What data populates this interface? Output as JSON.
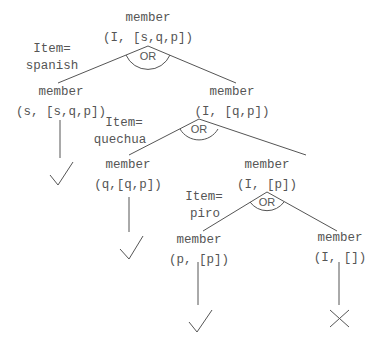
{
  "diagram": {
    "type": "and-or search tree",
    "nodes": {
      "root": {
        "line1": "member",
        "line2": "(I, [s,q,p])"
      },
      "n_s": {
        "line1": "member",
        "line2": "(s, [s,q,p])"
      },
      "n_rest1": {
        "line1": "member",
        "line2": "(I, [q,p])"
      },
      "n_q": {
        "line1": "member",
        "line2": "(q,[q,p])"
      },
      "n_rest2": {
        "line1": "member",
        "line2": "(I, [p])"
      },
      "n_p": {
        "line1": "member",
        "line2": "(p, [p])"
      },
      "n_empty": {
        "line1": "member",
        "line2": "(I, [])"
      }
    },
    "or_labels": [
      "OR",
      "OR",
      "OR"
    ],
    "bindings": [
      {
        "line1": "Item=",
        "line2": "spanish"
      },
      {
        "line1": "Item=",
        "line2": "quechua"
      },
      {
        "line1": "Item=",
        "line2": "piro"
      }
    ],
    "outcomes": {
      "n_s": "success",
      "n_q": "success",
      "n_p": "success",
      "n_empty": "failure"
    },
    "icons": {
      "success": "check-mark-icon",
      "failure": "cross-mark-icon"
    }
  }
}
